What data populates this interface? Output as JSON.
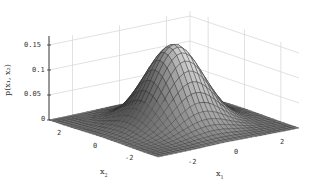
{
  "chart_data": {
    "type": "surface",
    "title": "",
    "xlabel": "x1",
    "ylabel": "x2",
    "zlabel": "p(x1, x2)",
    "x_ticks": [
      "-2",
      "0",
      "2"
    ],
    "y_ticks": [
      "2",
      "0",
      "-2"
    ],
    "z_ticks": [
      "0",
      "0.05",
      "0.1",
      "0.15"
    ],
    "xlim": [
      -3,
      3
    ],
    "ylim": [
      -3,
      3
    ],
    "zlim": [
      0,
      0.16
    ],
    "peak": {
      "x1": 0,
      "x2": 0,
      "z": 0.159
    },
    "grid": true,
    "colormap": "gray"
  },
  "labels": {
    "zlabel": "p(x₁, x₂)",
    "xlabel": "x",
    "xlabel_sub": "1",
    "ylabel": "x",
    "ylabel_sub": "2",
    "z_ticks": [
      "0.15",
      "0.1",
      "0.05",
      "0"
    ],
    "y_ticks": [
      "2",
      "0",
      "-2"
    ],
    "x_ticks": [
      "-2",
      "0",
      "2"
    ]
  }
}
